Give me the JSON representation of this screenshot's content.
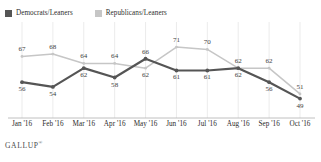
{
  "legend": {
    "items": [
      {
        "label": "Democrats/Leaners",
        "color": "#555555",
        "key": "democrats"
      },
      {
        "label": "Republicans/Leaners",
        "color": "#c6c6c6",
        "key": "republicans"
      }
    ]
  },
  "footer": {
    "brand": "GALLUP",
    "trademark": "®"
  },
  "chart_data": {
    "type": "line",
    "title": "",
    "subtitle": "",
    "xlabel": "",
    "ylabel": "",
    "grid": "vertical",
    "legend_position": "top-left",
    "categories": [
      "Jan '16",
      "Feb '16",
      "Mar '16",
      "Apr '16",
      "May '16",
      "Jun '16",
      "Jul '16",
      "Aug '16",
      "Sep '16",
      "Oct '16"
    ],
    "ylim": [
      45,
      74
    ],
    "series": [
      {
        "name": "Democrats/Leaners",
        "color": "#555555",
        "values": [
          56,
          54,
          62,
          58,
          66,
          61,
          61,
          62,
          56,
          49
        ],
        "label_positions": [
          "below",
          "below",
          "below",
          "below",
          "above",
          "below",
          "below",
          "below",
          "below",
          "below"
        ]
      },
      {
        "name": "Republicans/Leaners",
        "color": "#c6c6c6",
        "values": [
          67,
          68,
          64,
          64,
          62,
          71,
          70,
          62,
          62,
          51
        ],
        "label_positions": [
          "above",
          "above",
          "above",
          "above",
          "below",
          "above",
          "above",
          "above",
          "above",
          "above"
        ]
      }
    ]
  }
}
